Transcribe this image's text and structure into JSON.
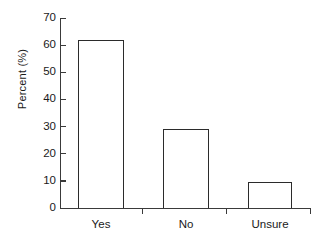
{
  "chart_data": {
    "type": "bar",
    "title": "",
    "subtitle": "",
    "xlabel": "",
    "ylabel": "Percent (%)",
    "categories": [
      "Yes",
      "No",
      "Unsure"
    ],
    "values": [
      62,
      29,
      9.7
    ],
    "ylim": [
      0,
      70
    ],
    "yticks": [
      0,
      10,
      20,
      30,
      40,
      50,
      60,
      70
    ],
    "ytick_labels": [
      "0",
      "10",
      "20",
      "30",
      "40",
      "50",
      "60",
      "70"
    ],
    "grid": false,
    "legend": null,
    "series": [
      {
        "name": "Percent",
        "values": [
          62,
          29,
          9.7
        ]
      }
    ],
    "colors": {
      "bar_fill": "#ffffff",
      "bar_stroke": "#2b2b2b",
      "axis": "#3a3a3a",
      "text": "#1a1a1a",
      "background": "#ffffff"
    }
  },
  "axes": {
    "y_title": "Percent (%)"
  }
}
